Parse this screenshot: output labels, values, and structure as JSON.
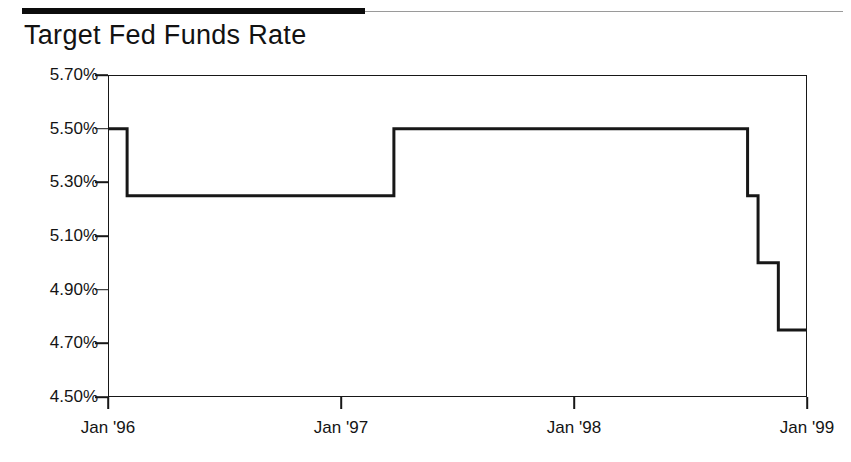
{
  "header": {
    "rule_color": "#0c0c0c",
    "rule_thin_color": "#9a9a9a"
  },
  "title": "Target Fed Funds Rate",
  "chart_data": {
    "type": "line",
    "line_style": "step",
    "title": "Target Fed Funds Rate",
    "xlabel": "",
    "ylabel": "",
    "grid": false,
    "legend": false,
    "line_color": "#171717",
    "axis_color": "#171717",
    "background": "#ffffff",
    "xlim": [
      1996.0,
      1999.0
    ],
    "ylim": [
      4.5,
      5.7
    ],
    "ytick_values": [
      5.7,
      5.5,
      5.3,
      5.1,
      4.9,
      4.7,
      4.5
    ],
    "ytick_labels": [
      "5.70%",
      "5.50%",
      "5.30%",
      "5.10%",
      "4.90%",
      "4.70%",
      "4.50%"
    ],
    "xtick_values": [
      1996.0,
      1997.0,
      1998.0,
      1999.0
    ],
    "xtick_labels": [
      "Jan '96",
      "Jan '97",
      "Jan '98",
      "Jan '99"
    ],
    "series": [
      {
        "name": "Target Fed Funds Rate",
        "x": [
          1996.0,
          1996.082,
          1996.082,
          1997.227,
          1997.227,
          1998.745,
          1998.745,
          1998.79,
          1998.79,
          1998.877,
          1998.877,
          1999.0
        ],
        "y": [
          5.5,
          5.5,
          5.25,
          5.25,
          5.5,
          5.5,
          5.25,
          5.25,
          5.0,
          5.0,
          4.75,
          4.75
        ]
      }
    ],
    "steps": [
      {
        "date": "Jan '96",
        "x": 1996.0,
        "rate": 5.5
      },
      {
        "date": "Jan 31 '96",
        "x": 1996.082,
        "rate": 5.25
      },
      {
        "date": "Mar '97",
        "x": 1997.227,
        "rate": 5.5
      },
      {
        "date": "Sep 29 '98",
        "x": 1998.745,
        "rate": 5.25
      },
      {
        "date": "Oct 15 '98",
        "x": 1998.79,
        "rate": 5.0
      },
      {
        "date": "Nov 17 '98",
        "x": 1998.877,
        "rate": 4.75
      },
      {
        "date": "Jan '99",
        "x": 1999.0,
        "rate": 4.75
      }
    ]
  }
}
